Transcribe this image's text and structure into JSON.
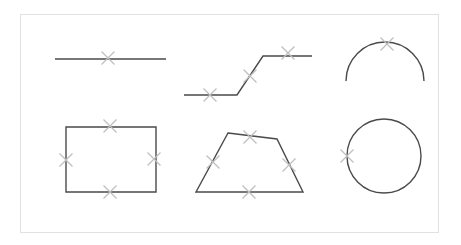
{
  "figure": {
    "background_color": "#ffffff",
    "border": {
      "name": "figure-border",
      "x": 20,
      "y": 14,
      "width": 418,
      "height": 218,
      "color": "#e2e2e2",
      "stroke_width": 1
    },
    "shape_color": "#4a4a4a",
    "shape_stroke_width": 1.4,
    "marker_color": "#bfbfbf",
    "marker_stroke_width": 1.2,
    "marker_size": 13,
    "shapes": [
      {
        "id": "straight-line",
        "label": "Straight line segment",
        "type": "polyline",
        "points": [
          [
            55,
            59
          ],
          [
            166,
            59
          ]
        ],
        "markers": [
          [
            108,
            58
          ]
        ]
      },
      {
        "id": "step-line",
        "label": "Step / zigzag polyline",
        "type": "polyline",
        "points": [
          [
            184,
            95
          ],
          [
            237,
            95
          ],
          [
            263,
            56
          ],
          [
            312,
            56
          ]
        ],
        "markers": [
          [
            210,
            95
          ],
          [
            250,
            76
          ],
          [
            288,
            53
          ]
        ]
      },
      {
        "id": "arc",
        "label": "Open upper arc",
        "type": "arc",
        "center": [
          385,
          81
        ],
        "radius": 39,
        "start_angle_deg": 180,
        "end_angle_deg": 360,
        "markers": [
          [
            387,
            44
          ]
        ]
      },
      {
        "id": "rectangle",
        "label": "Rectangle",
        "type": "polygon",
        "points": [
          [
            66,
            127
          ],
          [
            156,
            127
          ],
          [
            156,
            192
          ],
          [
            66,
            192
          ]
        ],
        "markers": [
          [
            110,
            126
          ],
          [
            154,
            159
          ],
          [
            110,
            192
          ],
          [
            66,
            160
          ]
        ]
      },
      {
        "id": "trapezoid",
        "label": "Trapezoid",
        "type": "polygon",
        "points": [
          [
            228,
            133
          ],
          [
            277,
            139
          ],
          [
            303,
            192
          ],
          [
            196,
            192
          ]
        ],
        "markers": [
          [
            250,
            137
          ],
          [
            289,
            165
          ],
          [
            249,
            192
          ],
          [
            213,
            162
          ]
        ]
      },
      {
        "id": "circle",
        "label": "Circle",
        "type": "circle",
        "center": [
          384,
          156
        ],
        "radius": 37,
        "markers": [
          [
            347,
            156
          ]
        ]
      }
    ]
  }
}
